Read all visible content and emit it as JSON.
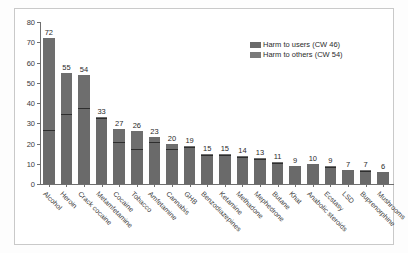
{
  "chart_data": {
    "type": "bar",
    "stacked": true,
    "title": "",
    "xlabel": "",
    "ylabel": "Overall harm score",
    "ylim": [
      0,
      80
    ],
    "yticks": [
      0,
      10,
      20,
      30,
      40,
      50,
      60,
      70,
      80
    ],
    "grid": false,
    "legend_position": "top-right",
    "categories": [
      "Alcohol",
      "Heroin",
      "Crack cocaine",
      "Metamfetamine",
      "Cocaine",
      "Tobacco",
      "Amfetamine",
      "Cannabis",
      "GHB",
      "Benzodiazepines",
      "Ketamine",
      "Methadone",
      "Mephedrone",
      "Butane",
      "Khat",
      "Anabolic steroids",
      "Ecstasy",
      "LSD",
      "Buprenorphine",
      "Mushrooms"
    ],
    "totals": [
      72,
      55,
      54,
      33,
      27,
      26,
      23,
      20,
      19,
      15,
      15,
      14,
      13,
      11,
      9,
      10,
      9,
      7,
      7,
      6
    ],
    "series": [
      {
        "name": "Harm to users (CW 46)",
        "color": "#6a6a6a",
        "values": [
          26,
          34,
          37,
          32,
          20,
          17,
          20,
          17,
          18,
          14,
          14,
          13,
          12,
          10,
          9,
          10,
          8,
          7,
          6,
          6
        ]
      },
      {
        "name": "Harm to others (CW 54)",
        "color": "#7a7a7a",
        "values": [
          46,
          21,
          17,
          1,
          7,
          9,
          3,
          3,
          1,
          1,
          1,
          1,
          1,
          1,
          0,
          0,
          1,
          0,
          1,
          0
        ]
      }
    ]
  },
  "legend": {
    "items": [
      {
        "label": "Harm to users (CW 46)"
      },
      {
        "label": "Harm to others (CW 54)"
      }
    ]
  },
  "axis": {
    "y_title": "Overall harm score"
  }
}
